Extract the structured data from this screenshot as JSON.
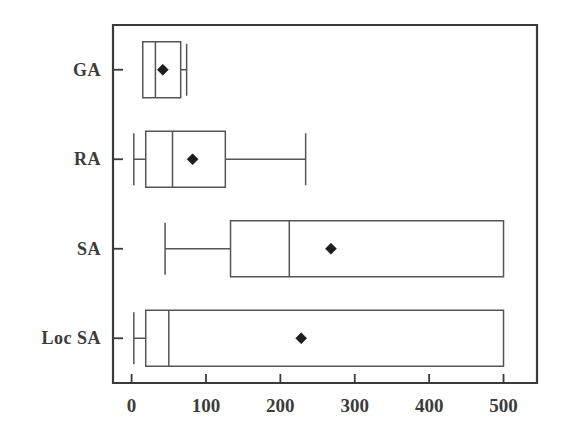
{
  "chart_data": {
    "type": "box",
    "title": "",
    "xlabel": "",
    "ylabel": "",
    "orientation": "horizontal",
    "xlim": [
      -25,
      545
    ],
    "grid": false,
    "legend": null,
    "categories": [
      "GA",
      "RA",
      "SA",
      "Loc SA"
    ],
    "xticks": [
      0,
      100,
      200,
      300,
      400,
      500
    ],
    "xtick_labels": [
      "0",
      "100",
      "200",
      "300",
      "400",
      "500"
    ],
    "boxes": [
      {
        "category": "GA",
        "whisker_low": 15,
        "q1": 15,
        "median": 32,
        "q3": 66,
        "whisker_high": 74,
        "mean": 42
      },
      {
        "category": "RA",
        "whisker_low": 3,
        "q1": 19,
        "median": 55,
        "q3": 126,
        "whisker_high": 234,
        "mean": 82
      },
      {
        "category": "SA",
        "whisker_low": 45,
        "q1": 133,
        "median": 212,
        "q3": 500,
        "whisker_high": 500,
        "mean": 268
      },
      {
        "category": "Loc SA",
        "whisker_low": 3,
        "q1": 19,
        "median": 50,
        "q3": 500,
        "whisker_high": 500,
        "mean": 228
      }
    ]
  }
}
